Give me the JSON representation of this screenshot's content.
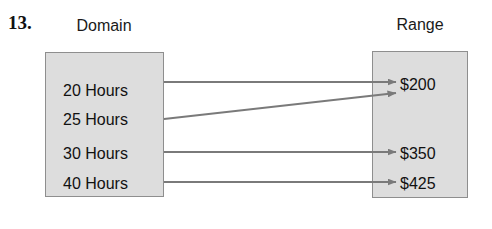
{
  "problem": {
    "number": "13."
  },
  "headings": {
    "domain": "Domain",
    "range": "Range"
  },
  "domain": {
    "items": [
      {
        "label": "20 Hours",
        "y": 83
      },
      {
        "label": "25 Hours",
        "y": 112
      },
      {
        "label": "30 Hours",
        "y": 146
      },
      {
        "label": "40 Hours",
        "y": 176
      }
    ]
  },
  "range": {
    "items": [
      {
        "label": "$200",
        "y": 77
      },
      {
        "label": "$350",
        "y": 146
      },
      {
        "label": "$425",
        "y": 176
      }
    ]
  },
  "mapping": {
    "pairs": [
      {
        "from": "20 Hours",
        "to": "$200",
        "x1": 164,
        "y1": 82,
        "x2": 396,
        "y2": 82
      },
      {
        "from": "25 Hours",
        "to": "$200",
        "x1": 164,
        "y1": 119,
        "x2": 396,
        "y2": 93
      },
      {
        "from": "30 Hours",
        "to": "$350",
        "x1": 164,
        "y1": 152,
        "x2": 396,
        "y2": 152
      },
      {
        "from": "40 Hours",
        "to": "$425",
        "x1": 164,
        "y1": 182,
        "x2": 396,
        "y2": 182
      }
    ]
  },
  "colors": {
    "box_fill": "#dddddd",
    "box_border": "#8e8e8e",
    "arrow": "#7a7a7a",
    "text": "#111111",
    "page_background": "#ffffff"
  }
}
